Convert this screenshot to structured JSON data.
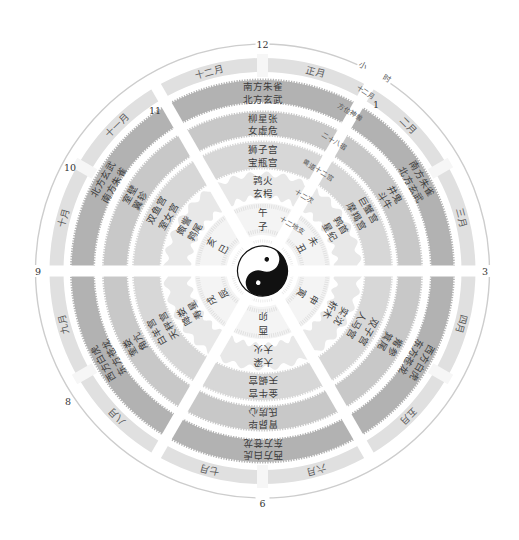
{
  "diagram": {
    "hours_label": "小时",
    "clock_numbers": [
      "12",
      "1",
      "3",
      "6",
      "8",
      "9",
      "10",
      "11"
    ],
    "ring_labels": {
      "months": "十二月",
      "four_symbols": "方位神兽",
      "mansions": "二十八宿",
      "zodiac": "黄道十二宫",
      "stations": "十二次",
      "branches": "十二地支"
    },
    "months": [
      "正月",
      "二月",
      "三月",
      "四月",
      "五月",
      "六月",
      "七月",
      "八月",
      "九月",
      "十月",
      "十一月",
      "十二月"
    ],
    "sectors": [
      {
        "four_symbols": [
          "南方朱雀",
          "北方玄武"
        ],
        "mansions": [
          "柳星张",
          "女虚危"
        ],
        "zodiac": [
          "狮子宫",
          "宝瓶宫"
        ],
        "stations": [
          "鹑火",
          "玄枵"
        ],
        "branches": [
          "午",
          "子"
        ]
      },
      {
        "four_symbols": [
          "南方朱雀",
          "北方玄武"
        ],
        "mansions": [
          "井鬼",
          "斗牛"
        ],
        "zodiac": [
          "巨蟹宫",
          "摩羯宫"
        ],
        "stations": [
          "鹑首",
          "星纪"
        ],
        "branches": [
          "未",
          "丑"
        ]
      },
      {
        "four_symbols": [
          "西方白虎",
          "东方苍龙"
        ],
        "mansions": [
          "觜参",
          "箕尾"
        ],
        "zodiac": [
          "双子宫",
          "人马宫"
        ],
        "stations": [
          "实沈",
          "析木"
        ],
        "branches": [
          "申",
          "寅"
        ]
      },
      {
        "four_symbols": [
          "西方白虎",
          "东方苍龙"
        ],
        "mansions": [
          "胃昴毕",
          "氐房心"
        ],
        "zodiac": [
          "金牛宫",
          "天蝎宫"
        ],
        "stations": [
          "大梁",
          "大火"
        ],
        "branches": [
          "酉",
          "卯"
        ]
      },
      {
        "four_symbols": [
          "西方白虎",
          "东方苍龙"
        ],
        "mansions": [
          "奎娄",
          "角亢"
        ],
        "zodiac": [
          "白羊宫",
          "天秤宫"
        ],
        "stations": [
          "降娄",
          "寿星"
        ],
        "branches": [
          "戌",
          "辰"
        ]
      },
      {
        "four_symbols": [
          "北方玄武",
          "南方朱雀"
        ],
        "mansions": [
          "室壁",
          "翼轸"
        ],
        "zodiac": [
          "双鱼宫",
          "室女宫"
        ],
        "stations": [
          "娵訾",
          "鹑尾"
        ],
        "branches": [
          "亥",
          "巳"
        ]
      }
    ],
    "center_symbol": "yin-yang-icon"
  },
  "colors": {
    "outer_circle": "#cdcdcd",
    "month_ring": "#e0e0e0",
    "four_symbols": "#b2b2b2",
    "mansions": "#c8c8c8",
    "zodiac": "#d7d7d7",
    "stations": "#e8e8e8",
    "branches": "#f4f4f4",
    "yin": "#111111",
    "yang": "#ffffff"
  }
}
